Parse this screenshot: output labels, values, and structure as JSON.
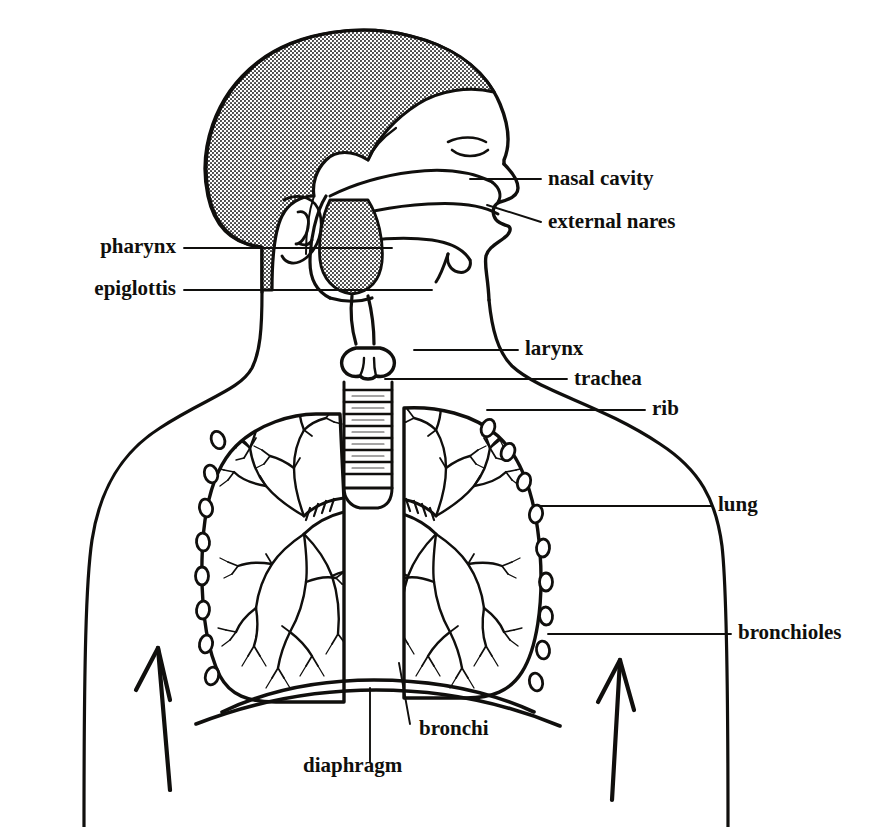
{
  "figure": {
    "style": "black-and-white line drawing, labelled anatomical diagram",
    "background_color": "#ffffff",
    "ink_color": "#100f0d",
    "hair_fill": "#b9b9b9"
  },
  "labels": [
    {
      "id": "nasal-cavity",
      "text": "nasal cavity",
      "x": 548,
      "y": 185,
      "anchor": "start",
      "font_size": 21
    },
    {
      "id": "external-nares",
      "text": "external nares",
      "x": 548,
      "y": 228,
      "anchor": "start",
      "font_size": 21
    },
    {
      "id": "pharynx",
      "text": "pharynx",
      "x": 176,
      "y": 253,
      "anchor": "end",
      "font_size": 21
    },
    {
      "id": "epiglottis",
      "text": "epiglottis",
      "x": 176,
      "y": 295,
      "anchor": "end",
      "font_size": 21
    },
    {
      "id": "larynx",
      "text": "larynx",
      "x": 525,
      "y": 355,
      "anchor": "start",
      "font_size": 21
    },
    {
      "id": "trachea",
      "text": "trachea",
      "x": 574,
      "y": 385,
      "anchor": "start",
      "font_size": 21
    },
    {
      "id": "rib",
      "text": "rib",
      "x": 652,
      "y": 415,
      "anchor": "start",
      "font_size": 21
    },
    {
      "id": "lung",
      "text": "lung",
      "x": 718,
      "y": 511,
      "anchor": "start",
      "font_size": 21
    },
    {
      "id": "bronchioles",
      "text": "bronchioles",
      "x": 738,
      "y": 639,
      "anchor": "start",
      "font_size": 21
    },
    {
      "id": "bronchi",
      "text": "bronchi",
      "x": 419,
      "y": 735,
      "anchor": "start",
      "font_size": 21
    },
    {
      "id": "diaphragm",
      "text": "diaphragm",
      "x": 303,
      "y": 772,
      "anchor": "start",
      "font_size": 21
    }
  ],
  "leader_lines": [
    {
      "id": "leader-nasal-cavity",
      "points": "541,179 470,179"
    },
    {
      "id": "leader-external-nares",
      "points": "541,222 487,205"
    },
    {
      "id": "leader-pharynx",
      "points": "184,248 392,248"
    },
    {
      "id": "leader-epiglottis",
      "points": "184,290 432,290"
    },
    {
      "id": "leader-larynx",
      "points": "518,350 414,350"
    },
    {
      "id": "leader-trachea",
      "points": "567,379 385,379"
    },
    {
      "id": "leader-rib",
      "points": "645,410 487,410"
    },
    {
      "id": "leader-lung",
      "points": "711,506 540,506"
    },
    {
      "id": "leader-bronchioles",
      "points": "731,634 548,634"
    },
    {
      "id": "leader-bronchi",
      "points": "410,724 399,663"
    },
    {
      "id": "leader-diaphragm",
      "points": "370,762 370,688"
    }
  ],
  "anatomy_parts": [
    {
      "id": "head-profile",
      "name": "head in lateral profile facing right"
    },
    {
      "id": "hair-mass",
      "name": "stippled hair covering scalp"
    },
    {
      "id": "ear",
      "name": "external ear"
    },
    {
      "id": "nasal-cavity-structure",
      "name": "nasal cavity passage"
    },
    {
      "id": "oral-cavity",
      "name": "mouth, palate and tongue"
    },
    {
      "id": "pharynx-structure",
      "name": "pharynx passage behind tongue"
    },
    {
      "id": "epiglottis-structure",
      "name": "epiglottis flap"
    },
    {
      "id": "larynx-structure",
      "name": "larynx voice box"
    },
    {
      "id": "trachea-structure",
      "name": "trachea with cartilage rings"
    },
    {
      "id": "left-lung",
      "name": "left lung with bronchial tree"
    },
    {
      "id": "right-lung",
      "name": "right lung with bronchial tree"
    },
    {
      "id": "rib-cage",
      "name": "ribs shown in cross-section as ovals"
    },
    {
      "id": "diaphragm-structure",
      "name": "diaphragm arc below lungs"
    },
    {
      "id": "torso-outline",
      "name": "neck, shoulders and torso outline"
    },
    {
      "id": "airflow-arrow-left",
      "name": "upward airflow arrow, left"
    },
    {
      "id": "airflow-arrow-right",
      "name": "upward airflow arrow, right"
    }
  ]
}
